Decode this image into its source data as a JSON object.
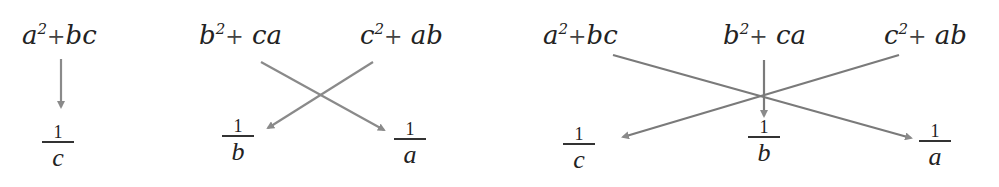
{
  "colors": {
    "arrow": "#8a8a8a",
    "text": "#222222"
  },
  "diagram1": {
    "top": [
      {
        "base": "a",
        "exp": "2",
        "op": "+",
        "rest": "bc"
      }
    ],
    "bottom": [
      {
        "num": "1",
        "den": "c"
      }
    ]
  },
  "diagram2": {
    "top": [
      {
        "base": "b",
        "exp": "2",
        "op": "+",
        "rest": "ca"
      },
      {
        "base": "c",
        "exp": "2",
        "op": "+",
        "rest": "ab"
      }
    ],
    "bottom": [
      {
        "num": "1",
        "den": "b"
      },
      {
        "num": "1",
        "den": "a"
      }
    ]
  },
  "diagram3": {
    "top": [
      {
        "base": "a",
        "exp": "2",
        "op": "+",
        "rest": "bc"
      },
      {
        "base": "b",
        "exp": "2",
        "op": "+",
        "rest": "ca"
      },
      {
        "base": "c",
        "exp": "2",
        "op": "+",
        "rest": "ab"
      }
    ],
    "bottom": [
      {
        "num": "1",
        "den": "c"
      },
      {
        "num": "1",
        "den": "b"
      },
      {
        "num": "1",
        "den": "a"
      }
    ]
  }
}
